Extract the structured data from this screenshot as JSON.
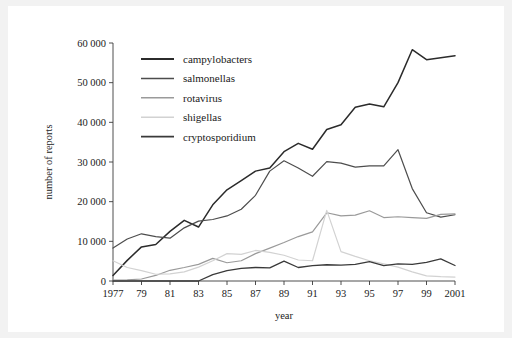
{
  "chart_data": {
    "type": "line",
    "title": "",
    "xlabel": "year",
    "ylabel": "number of reports",
    "xlim": [
      1977,
      2001
    ],
    "ylim": [
      0,
      60000
    ],
    "grid": false,
    "legend_position": "upper-left-inside",
    "x": [
      1977,
      1978,
      1979,
      1980,
      1981,
      1982,
      1983,
      1984,
      1985,
      1986,
      1987,
      1988,
      1989,
      1990,
      1991,
      1992,
      1993,
      1994,
      1995,
      1996,
      1997,
      1998,
      1999,
      2000,
      2001
    ],
    "xticks": [
      1977,
      1979,
      1981,
      1983,
      1985,
      1987,
      1989,
      1991,
      1993,
      1995,
      1997,
      1999,
      2001
    ],
    "xticklabels": [
      "1977",
      "79",
      "81",
      "83",
      "85",
      "87",
      "89",
      "91",
      "93",
      "95",
      "97",
      "99",
      "2001"
    ],
    "yticks": [
      0,
      10000,
      20000,
      30000,
      40000,
      50000,
      60000
    ],
    "yticklabels": [
      "0",
      "10 000",
      "20 000",
      "30 000",
      "40 000",
      "50 000",
      "60 000"
    ],
    "series": [
      {
        "name": "campylobacters",
        "color": "#2b2b2b",
        "width": 1.5,
        "values": [
          1400,
          5200,
          8600,
          9200,
          12500,
          15300,
          13600,
          19200,
          23000,
          25300,
          27700,
          28500,
          32600,
          34700,
          33200,
          38200,
          39400,
          43800,
          44600,
          43900,
          50000,
          58300,
          55800,
          56300,
          56800
        ]
      },
      {
        "name": "salmonellas",
        "color": "#4d4d4d",
        "width": 1.2,
        "values": [
          8300,
          10600,
          11900,
          11200,
          10800,
          13400,
          15100,
          15500,
          16400,
          18100,
          21600,
          27700,
          30300,
          28500,
          26400,
          30100,
          29700,
          28700,
          29000,
          29000,
          33100,
          23300,
          17200,
          16100,
          16700
        ]
      },
      {
        "name": "rotavirus",
        "color": "#9a9a9a",
        "width": 1.2,
        "values": [
          200,
          300,
          500,
          1400,
          2700,
          3400,
          4200,
          5700,
          4600,
          5100,
          6900,
          8300,
          9700,
          11200,
          12400,
          17200,
          16400,
          16600,
          17700,
          16000,
          16200,
          16000,
          15800,
          16800,
          16900
        ]
      },
      {
        "name": "shigellas",
        "color": "#d2d2d2",
        "width": 1.2,
        "values": [
          5100,
          3400,
          2600,
          1700,
          1800,
          2300,
          3500,
          5100,
          6900,
          6700,
          7700,
          7200,
          6500,
          5300,
          5100,
          17800,
          7400,
          6200,
          5100,
          4300,
          3500,
          2300,
          1300,
          1100,
          1000
        ]
      },
      {
        "name": "cryptosporidium",
        "color": "#3a3a3a",
        "width": 1.3,
        "values": [
          0,
          0,
          0,
          0,
          0,
          0,
          0,
          1600,
          2600,
          3200,
          3400,
          3300,
          5000,
          3400,
          3900,
          4100,
          4000,
          4200,
          4900,
          3900,
          4300,
          4200,
          4700,
          5600,
          3900
        ]
      }
    ]
  },
  "legend": {
    "items": [
      {
        "label": "campylobacters"
      },
      {
        "label": "salmonellas"
      },
      {
        "label": "rotavirus"
      },
      {
        "label": "shigellas"
      },
      {
        "label": "cryptosporidium"
      }
    ]
  }
}
